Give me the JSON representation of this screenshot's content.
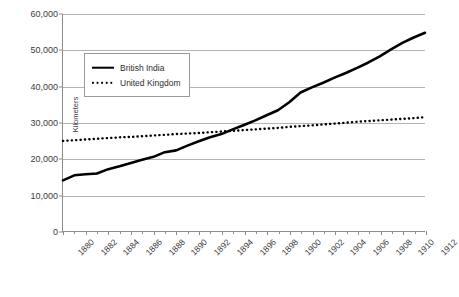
{
  "chart_data": {
    "type": "line",
    "title": "",
    "xlabel": "",
    "ylabel": "Kilometers",
    "xlim": [
      1880,
      1912
    ],
    "ylim": [
      0,
      60000
    ],
    "grid": true,
    "legend_position": "upper-left-inside",
    "y_ticks": [
      0,
      10000,
      20000,
      30000,
      40000,
      50000,
      60000
    ],
    "y_tick_labels": [
      "0",
      "10,000",
      "20,000",
      "30,000",
      "40,000",
      "50,000",
      "60,000"
    ],
    "x_ticks": [
      1880,
      1882,
      1884,
      1886,
      1888,
      1890,
      1892,
      1894,
      1896,
      1898,
      1900,
      1902,
      1904,
      1906,
      1908,
      1910,
      1912
    ],
    "x_tick_labels": [
      "1880",
      "1882",
      "1884",
      "1886",
      "1888",
      "1890",
      "1892",
      "1894",
      "1896",
      "1898",
      "1900",
      "1902",
      "1904",
      "1906",
      "1908",
      "1910",
      "1912"
    ],
    "x": [
      1880,
      1881,
      1882,
      1883,
      1884,
      1885,
      1886,
      1887,
      1888,
      1889,
      1890,
      1891,
      1892,
      1893,
      1894,
      1895,
      1896,
      1897,
      1898,
      1899,
      1900,
      1901,
      1902,
      1903,
      1904,
      1905,
      1906,
      1907,
      1908,
      1909,
      1910,
      1911,
      1912
    ],
    "series": [
      {
        "name": "British India",
        "style": "solid",
        "color": "#000000",
        "values": [
          14000,
          15400,
          15700,
          15900,
          17100,
          17900,
          18800,
          19700,
          20500,
          21800,
          22300,
          23600,
          24800,
          25900,
          26800,
          28100,
          29300,
          30600,
          32000,
          33400,
          35600,
          38300,
          39700,
          41000,
          42400,
          43700,
          45100,
          46600,
          48300,
          50200,
          52000,
          53500,
          54800
        ]
      },
      {
        "name": "United Kingdom",
        "style": "dotted",
        "color": "#000000",
        "values": [
          24900,
          25100,
          25300,
          25500,
          25700,
          25900,
          26000,
          26200,
          26400,
          26600,
          26800,
          26950,
          27100,
          27300,
          27500,
          27700,
          27900,
          28100,
          28300,
          28500,
          28800,
          29000,
          29200,
          29450,
          29700,
          29950,
          30200,
          30400,
          30600,
          30800,
          31000,
          31200,
          31500
        ]
      }
    ]
  },
  "legend": {
    "items": [
      {
        "label": "British India",
        "style": "solid"
      },
      {
        "label": "United Kingdom",
        "style": "dotted"
      }
    ]
  },
  "caption": {
    "text": ""
  }
}
